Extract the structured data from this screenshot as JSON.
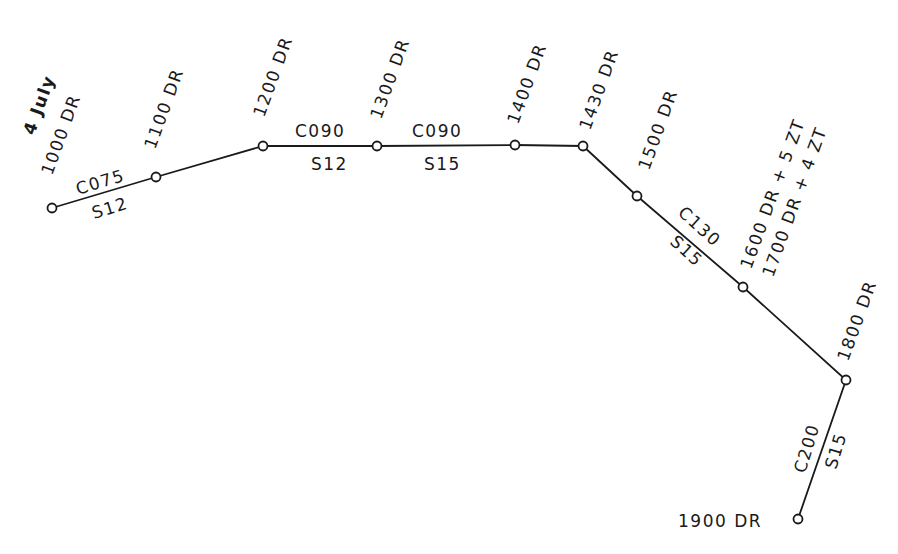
{
  "diagram": {
    "colors": {
      "ink": "#1a1a1a",
      "background": "#ffffff"
    },
    "date_label": "4 July",
    "positions": [
      {
        "id": "p1000",
        "label": "1000 DR",
        "x": 52,
        "y": 208
      },
      {
        "id": "p1100",
        "label": "1100 DR",
        "x": 156,
        "y": 177
      },
      {
        "id": "p1200",
        "label": "1200 DR",
        "x": 263,
        "y": 146
      },
      {
        "id": "p1300",
        "label": "1300 DR",
        "x": 377,
        "y": 146
      },
      {
        "id": "p1400",
        "label": "1400 DR",
        "x": 515,
        "y": 145
      },
      {
        "id": "p1430",
        "label": "1430 DR",
        "x": 583,
        "y": 146
      },
      {
        "id": "p1500",
        "label": "1500 DR",
        "x": 637,
        "y": 196
      },
      {
        "id": "p1600",
        "label": "1600 DR + 5 ZT",
        "label2": "1700 DR + 4 ZT",
        "x": 743,
        "y": 287
      },
      {
        "id": "p1800",
        "label": "1800 DR",
        "x": 846,
        "y": 380
      },
      {
        "id": "p1900",
        "label": "1900 DR",
        "x": 798,
        "y": 519
      }
    ],
    "legs": [
      {
        "course": "C075",
        "speed": "S12"
      },
      {
        "course": "C090",
        "speed": "S12"
      },
      {
        "course": "C090",
        "speed": "S15"
      },
      {
        "course": "C130",
        "speed": "S15"
      },
      {
        "course": "C200",
        "speed": "S15"
      }
    ]
  }
}
